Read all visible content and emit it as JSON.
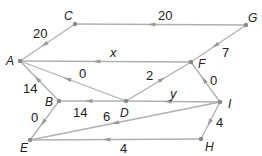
{
  "diagram": {
    "type": "directed-network",
    "colors": {
      "edge": "#b0b0b0",
      "node": "#8a8a8a",
      "text": "#222222",
      "arrow": "#999999"
    },
    "nodes": [
      {
        "id": "A",
        "label": "A",
        "x": 20,
        "y": 61,
        "lx": 6,
        "ly": 65
      },
      {
        "id": "B",
        "label": "B",
        "x": 59,
        "y": 101,
        "lx": 45,
        "ly": 106
      },
      {
        "id": "C",
        "label": "C",
        "x": 75,
        "y": 24,
        "lx": 64,
        "ly": 20
      },
      {
        "id": "D",
        "label": "D",
        "x": 126,
        "y": 101,
        "lx": 120,
        "ly": 117
      },
      {
        "id": "E",
        "label": "E",
        "x": 30,
        "y": 140,
        "lx": 20,
        "ly": 152
      },
      {
        "id": "F",
        "label": "F",
        "x": 191,
        "y": 62,
        "lx": 198,
        "ly": 68
      },
      {
        "id": "G",
        "label": "G",
        "x": 246,
        "y": 25,
        "lx": 248,
        "ly": 22
      },
      {
        "id": "H",
        "label": "H",
        "x": 201,
        "y": 139,
        "lx": 205,
        "ly": 151
      },
      {
        "id": "I",
        "label": "I",
        "x": 220,
        "y": 102,
        "lx": 228,
        "ly": 108
      }
    ],
    "edges": [
      {
        "from": "G",
        "to": "C",
        "label": "20",
        "lx": 158,
        "ly": 20
      },
      {
        "from": "C",
        "to": "A",
        "label": "20",
        "lx": 33,
        "ly": 38
      },
      {
        "from": "G",
        "to": "F",
        "label": "7",
        "lx": 222,
        "ly": 57
      },
      {
        "from": "F",
        "to": "A",
        "label": "x",
        "lx": 110,
        "ly": 57
      },
      {
        "from": "D",
        "to": "A",
        "label": "0",
        "lx": 79,
        "ly": 78
      },
      {
        "from": "D",
        "to": "F",
        "label": "2",
        "lx": 146,
        "ly": 80
      },
      {
        "from": "I",
        "to": "F",
        "label": "0",
        "lx": 210,
        "ly": 85
      },
      {
        "from": "I",
        "to": "D",
        "label": "y",
        "lx": 170,
        "ly": 98
      },
      {
        "from": "B",
        "to": "A",
        "label": "14",
        "lx": 23,
        "ly": 93
      },
      {
        "from": "D",
        "to": "B",
        "label": "14",
        "lx": 73,
        "ly": 117
      },
      {
        "from": "B",
        "to": "E",
        "label": "0",
        "lx": 31,
        "ly": 122
      },
      {
        "from": "I",
        "to": "E",
        "label": "6",
        "lx": 103,
        "ly": 121
      },
      {
        "from": "I",
        "to": "H",
        "label": "4",
        "lx": 216,
        "ly": 127
      },
      {
        "from": "H",
        "to": "E",
        "label": "4",
        "lx": 120,
        "ly": 153
      }
    ]
  }
}
